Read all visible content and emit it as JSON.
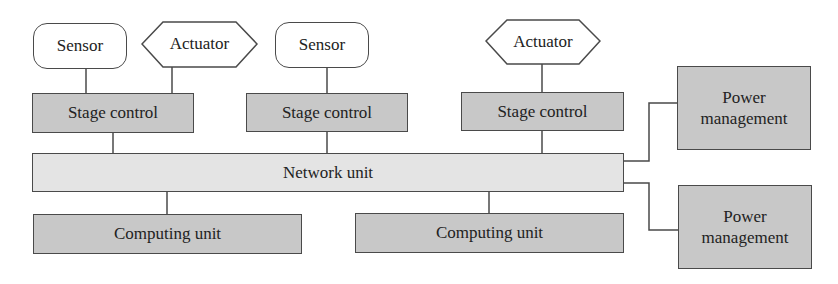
{
  "diagram": {
    "sensors": [
      {
        "label": "Sensor"
      },
      {
        "label": "Sensor"
      }
    ],
    "actuators": [
      {
        "label": "Actuator"
      },
      {
        "label": "Actuator"
      }
    ],
    "stage_controls": [
      {
        "label": "Stage control"
      },
      {
        "label": "Stage control"
      },
      {
        "label": "Stage control"
      }
    ],
    "network_unit": {
      "label": "Network unit"
    },
    "computing_units": [
      {
        "label": "Computing unit"
      },
      {
        "label": "Computing unit"
      }
    ],
    "power_management": [
      {
        "line1": "Power",
        "line2": "management"
      },
      {
        "line1": "Power",
        "line2": "management"
      }
    ],
    "colors": {
      "dark_fill": "#c8c8c8",
      "light_fill": "#e4e4e4",
      "stroke": "#4a4a4a"
    }
  }
}
